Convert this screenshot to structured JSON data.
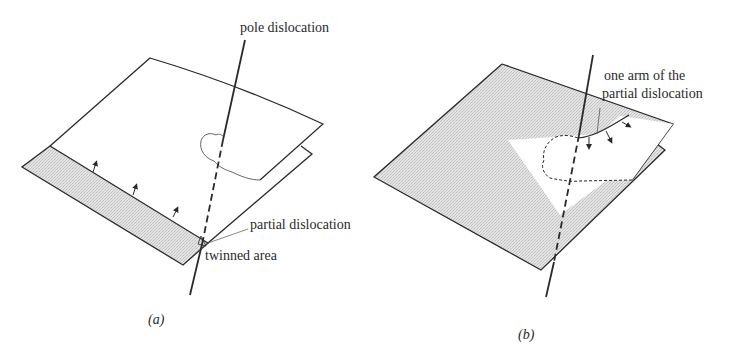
{
  "figure": {
    "panels": [
      {
        "id": "a",
        "caption": "(a)",
        "labels": {
          "pole_dislocation": "pole dislocation",
          "partial_dislocation": "partial dislocation",
          "twinned_area": "twinned area"
        }
      },
      {
        "id": "b",
        "caption": "(b)",
        "labels": {
          "arm_line1": "one arm of the",
          "arm_line2": "partial dislocation"
        }
      }
    ],
    "colors": {
      "line": "#2a2a2a",
      "shade": "#dcdcdc",
      "background": "#ffffff"
    }
  }
}
